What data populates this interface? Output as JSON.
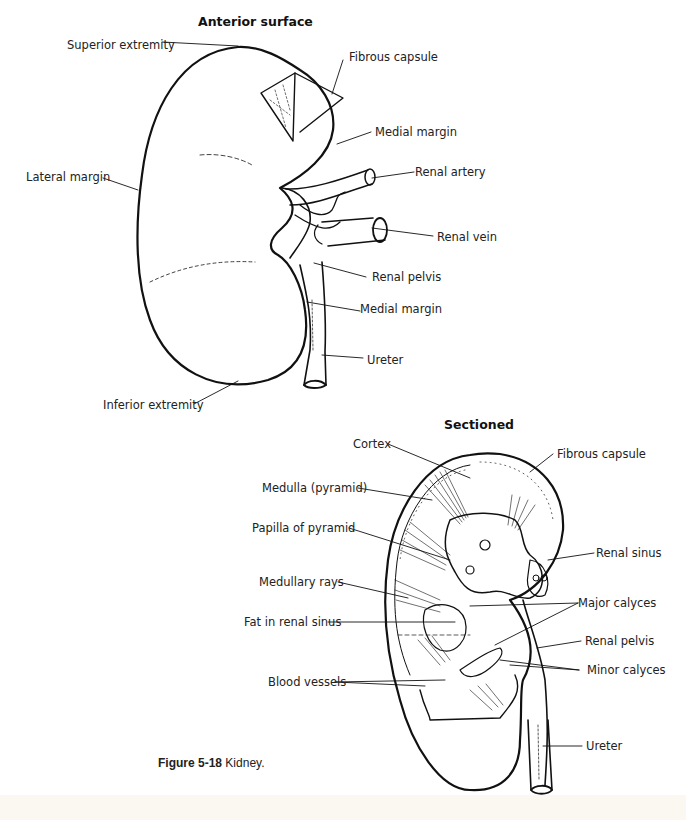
{
  "figure": {
    "caption_number": "Figure 5-18",
    "caption_text": " Kidney."
  },
  "anterior": {
    "heading": "Anterior surface",
    "labels": {
      "superior_extremity": "Superior extremity",
      "fibrous_capsule": "Fibrous capsule",
      "medial_margin_top": "Medial margin",
      "lateral_margin": "Lateral margin",
      "renal_artery": "Renal artery",
      "renal_vein": "Renal vein",
      "renal_pelvis": "Renal pelvis",
      "medial_margin_bottom": "Medial margin",
      "ureter": "Ureter",
      "inferior_extremity": "Inferior extremity"
    }
  },
  "sectioned": {
    "heading": "Sectioned",
    "labels": {
      "cortex": "Cortex",
      "fibrous_capsule": "Fibrous capsule",
      "medulla": "Medulla (pyramid)",
      "papilla": "Papilla of pyramid",
      "renal_sinus": "Renal sinus",
      "medullary_rays": "Medullary rays",
      "major_calyces": "Major calyces",
      "fat_in_renal_sinus": "Fat in renal sinus",
      "renal_pelvis": "Renal pelvis",
      "minor_calyces": "Minor calyces",
      "blood_vessels": "Blood vessels",
      "ureter": "Ureter"
    }
  },
  "colors": {
    "line": "#111111",
    "background": "#ffffff"
  }
}
